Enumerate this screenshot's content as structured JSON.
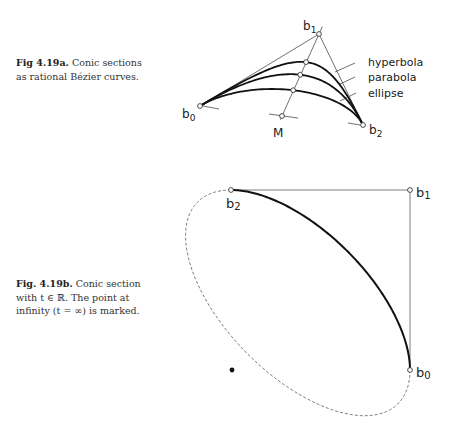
{
  "figure_a": {
    "caption_bold": "Fig 4.19a.",
    "caption_line1": " Conic sections",
    "caption_line2": "as rational Bézier curves.",
    "points": {
      "b0": {
        "label": "b",
        "sub": "0",
        "x": 200,
        "y": 106
      },
      "b1": {
        "label": "b",
        "sub": "1",
        "x": 319,
        "y": 34
      },
      "b2": {
        "label": "b",
        "sub": "2",
        "x": 363,
        "y": 125
      },
      "M": {
        "label": "M",
        "x": 282,
        "y": 116
      }
    },
    "curves": [
      {
        "name": "hyperbola",
        "label": "hyperbola",
        "weight": 1.9
      },
      {
        "name": "parabola",
        "label": "parabola",
        "weight": 1.0
      },
      {
        "name": "ellipse",
        "label": "ellipse",
        "weight": 0.45
      }
    ]
  },
  "figure_b": {
    "caption_bold": "Fig. 4.19b.",
    "caption_line1": " Conic section",
    "caption_line2": "with t ∈ ℝ. The point at",
    "caption_line3": "infinity (t = ∞) is marked.",
    "points": {
      "b0": {
        "label": "b",
        "sub": "0",
        "x": 410,
        "y": 370
      },
      "b1": {
        "label": "b",
        "sub": "1",
        "x": 410,
        "y": 190
      },
      "b2": {
        "label": "b",
        "sub": "2",
        "x": 231,
        "y": 190
      }
    },
    "weight": 0.45,
    "infinity_point": {
      "x": 232,
      "y": 370
    }
  }
}
